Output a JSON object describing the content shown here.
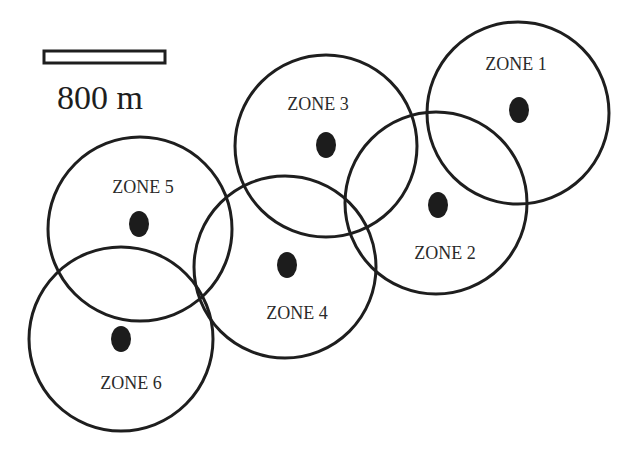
{
  "diagram": {
    "colors": {
      "stroke": "#1e1e1e",
      "dot": "#1c1c1c",
      "background": "#ffffff"
    },
    "scale_bar": {
      "label": "800 m",
      "x": 44,
      "y": 51,
      "width": 121,
      "height": 12
    },
    "zones": [
      {
        "label": "ZONE 1",
        "circle": {
          "cx": 518,
          "cy": 113,
          "r": 91
        },
        "dot": {
          "cx": 519,
          "cy": 110,
          "rx": 10,
          "ry": 13
        },
        "label_pos": {
          "x": 516,
          "y": 70
        }
      },
      {
        "label": "ZONE 2",
        "circle": {
          "cx": 436,
          "cy": 203,
          "r": 91
        },
        "dot": {
          "cx": 438,
          "cy": 205,
          "rx": 10,
          "ry": 13
        },
        "label_pos": {
          "x": 445,
          "y": 259
        }
      },
      {
        "label": "ZONE 3",
        "circle": {
          "cx": 326,
          "cy": 146,
          "r": 91
        },
        "dot": {
          "cx": 326,
          "cy": 145,
          "rx": 10,
          "ry": 13
        },
        "label_pos": {
          "x": 318,
          "y": 110
        }
      },
      {
        "label": "ZONE 4",
        "circle": {
          "cx": 285,
          "cy": 267,
          "r": 91
        },
        "dot": {
          "cx": 287,
          "cy": 265,
          "rx": 10,
          "ry": 13
        },
        "label_pos": {
          "x": 297,
          "y": 319
        }
      },
      {
        "label": "ZONE 5",
        "circle": {
          "cx": 140,
          "cy": 229,
          "r": 92
        },
        "dot": {
          "cx": 139,
          "cy": 224,
          "rx": 10,
          "ry": 13
        },
        "label_pos": {
          "x": 143,
          "y": 193
        }
      },
      {
        "label": "ZONE 6",
        "circle": {
          "cx": 121,
          "cy": 339,
          "r": 92
        },
        "dot": {
          "cx": 121,
          "cy": 339,
          "rx": 10,
          "ry": 13
        },
        "label_pos": {
          "x": 131,
          "y": 389
        }
      }
    ]
  }
}
